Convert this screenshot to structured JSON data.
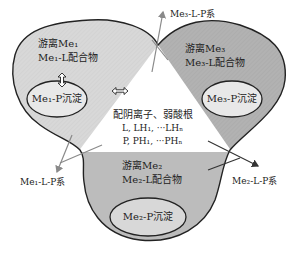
{
  "diagram": {
    "lobes": [
      {
        "id": "me1",
        "free": "游离Me₁",
        "complex": "Me₁-L配合物",
        "precip": "Me₁-P沉淀",
        "color": "#dcdcdc"
      },
      {
        "id": "me3",
        "free": "游离Me₃",
        "complex": "Me₃-L配合物",
        "precip": "Me₃-P沉淀",
        "color": "#b4b4b4"
      },
      {
        "id": "me2",
        "free": "游离Me₂",
        "complex": "Me₂-L配合物",
        "precip": "Me₂-P沉淀",
        "color": "#bdbdbd"
      }
    ],
    "center": {
      "title": "配阴离子、弱酸根",
      "line1": "L, LH₁, ···LHₙ",
      "line2": "P, PH₁, ···PHₙ"
    },
    "systems": {
      "me1": "Me₁-L-P系",
      "me2": "Me₂-L-P系",
      "me3": "Me₃-L-P系"
    },
    "colors": {
      "outline": "#222222",
      "ellipse_fill": "#e8e8e8",
      "arrow_gray": "#8a8a8a",
      "arrow_dark": "#333333"
    }
  }
}
